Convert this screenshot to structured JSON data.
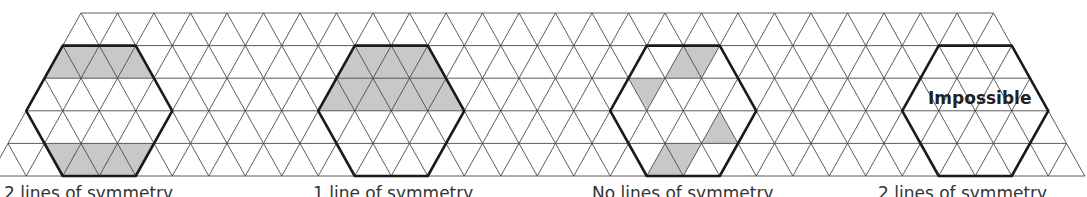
{
  "figure": {
    "grid": {
      "rows": 5,
      "row_y": [
        13,
        45.6,
        78.2,
        110.8,
        143.4,
        176
      ],
      "unit": 36.5,
      "row0_start_x": 81,
      "row0_vertices": 26,
      "colors": {
        "line": "#4a4a4a",
        "hex": "#1a1a1a",
        "shade": "#c8c8c8"
      }
    },
    "panels": [
      {
        "id": "hex-1",
        "caption": "2 lines of symmetry",
        "caption_x": 4,
        "hex_start_n": 0,
        "overlay_text": ""
      },
      {
        "id": "hex-2",
        "caption": "1 line of symmetry",
        "caption_x": 313,
        "hex_start_n": 8,
        "overlay_text": ""
      },
      {
        "id": "hex-3",
        "caption": "No lines of symmetry",
        "caption_x": 592,
        "hex_start_n": 16,
        "overlay_text": ""
      },
      {
        "id": "hex-4",
        "caption": "2 lines of symmetry",
        "caption_x": 878,
        "hex_start_n": 24,
        "overlay_text": "Impossible"
      }
    ]
  }
}
